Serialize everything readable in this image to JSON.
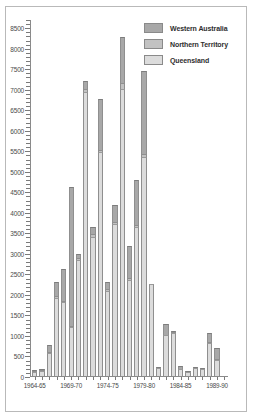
{
  "chart_data": {
    "type": "bar",
    "subtype": "stacked-vertical",
    "title": "",
    "subtitle": "",
    "xlabel": "",
    "ylabel": "",
    "ylim": [
      0,
      8700
    ],
    "ytick_step": 500,
    "ytick_minor_step": 100,
    "grid": false,
    "legend_position": "top-right",
    "ytick_labels": [
      "0",
      "500",
      "1000",
      "1500",
      "2000",
      "2500",
      "3000",
      "3500",
      "4000",
      "4500",
      "5000",
      "5500",
      "6000",
      "6500",
      "7000",
      "7500",
      "8000",
      "8500"
    ],
    "ytick_values": [
      0,
      500,
      1000,
      1500,
      2000,
      2500,
      3000,
      3500,
      4000,
      4500,
      5000,
      5500,
      6000,
      6500,
      7000,
      7500,
      8000,
      8500
    ],
    "categories": [
      "1964-65",
      "1965-66",
      "1966-67",
      "1967-68",
      "1968-69",
      "1969-70",
      "1970-71",
      "1971-72",
      "1972-73",
      "1973-74",
      "1974-75",
      "1975-76",
      "1976-77",
      "1977-78",
      "1978-79",
      "1979-80",
      "1980-81",
      "1981-82",
      "1982-83",
      "1983-84",
      "1984-85",
      "1985-86",
      "1986-87",
      "1987-88",
      "1988-89",
      "1989-90",
      "1990-91"
    ],
    "xtick_labels": [
      "1964-65",
      "1969-70",
      "1974-75",
      "1979-80",
      "1984-85",
      "1989-90"
    ],
    "xtick_category_index": [
      0,
      5,
      10,
      15,
      20,
      25
    ],
    "series": [
      {
        "name": "Queensland",
        "color": "#dcdcdc",
        "values": [
          100,
          120,
          560,
          1900,
          1800,
          1190,
          2830,
          6930,
          3390,
          5450,
          2080,
          3700,
          6990,
          2340,
          3640,
          5340,
          2250,
          190,
          1000,
          1040,
          170,
          90,
          190,
          180,
          800,
          390,
          0
        ]
      },
      {
        "name": "Northern Territory",
        "color": "#c2c2c2",
        "values": [
          20,
          10,
          30,
          60,
          40,
          30,
          50,
          70,
          60,
          60,
          40,
          60,
          150,
          40,
          40,
          60,
          0,
          0,
          0,
          30,
          0,
          0,
          0,
          0,
          30,
          20,
          0
        ]
      },
      {
        "name": "Western Australia",
        "color": "#a8a8a8",
        "values": [
          30,
          20,
          160,
          330,
          770,
          3390,
          100,
          200,
          170,
          1250,
          170,
          420,
          1110,
          780,
          1090,
          2040,
          0,
          30,
          270,
          30,
          70,
          20,
          10,
          10,
          210,
          270,
          0
        ]
      }
    ],
    "totals": [
      150,
      150,
      750,
      2290,
      2610,
      4610,
      2980,
      7200,
      3620,
      6760,
      2290,
      4180,
      8250,
      3160,
      4770,
      7440,
      2250,
      220,
      1270,
      1100,
      240,
      110,
      200,
      190,
      1040,
      680,
      0
    ]
  },
  "legend": {
    "items": [
      {
        "label": "Western Australia",
        "color": "#a8a8a8"
      },
      {
        "label": "Northern Territory",
        "color": "#c2c2c2"
      },
      {
        "label": "Queensland",
        "color": "#dcdcdc"
      }
    ]
  },
  "colors": {
    "western_australia": "#a8a8a8",
    "northern_territory": "#c2c2c2",
    "queensland": "#dcdcdc",
    "axis": "#8a8a8a",
    "frame": "#b9b9b9",
    "text": "#4a4a4a",
    "background": "#ffffff"
  }
}
